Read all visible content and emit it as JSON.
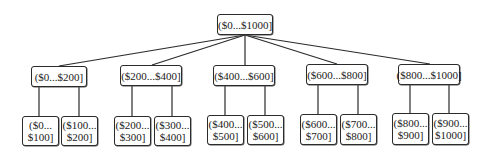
{
  "diagram": {
    "type": "tree",
    "root": {
      "label": "($0...$1000]",
      "box": [
        217,
        14,
        56,
        21
      ]
    },
    "level1": [
      {
        "label": "($0...$200]",
        "box": [
          31,
          66,
          56,
          21
        ],
        "anchor_x": 59
      },
      {
        "label": "($200...$400]",
        "box": [
          120,
          65,
          62,
          21
        ],
        "anchor_x": 152
      },
      {
        "label": "($400...$600]",
        "box": [
          213,
          65,
          62,
          21
        ],
        "anchor_x": 245
      },
      {
        "label": "($600...$800]",
        "box": [
          306,
          64,
          62,
          21
        ],
        "anchor_x": 337
      },
      {
        "label": "($800...$1000]",
        "box": [
          398,
          64,
          62,
          21
        ],
        "anchor_x": 430
      }
    ],
    "leaves": [
      {
        "line1": "($0...",
        "line2": "$100]",
        "box": [
          22,
          116,
          37,
          30
        ],
        "parent": 0,
        "line_x": 39
      },
      {
        "line1": "($100...",
        "line2": "$200]",
        "box": [
          61,
          116,
          37,
          30
        ],
        "parent": 0,
        "line_x": 79
      },
      {
        "line1": "($200...",
        "line2": "$300]",
        "box": [
          114,
          116,
          37,
          30
        ],
        "parent": 1,
        "line_x": 132
      },
      {
        "line1": "($300...",
        "line2": "$400]",
        "box": [
          154,
          116,
          37,
          30
        ],
        "parent": 1,
        "line_x": 172
      },
      {
        "line1": "($400...",
        "line2": "$500]",
        "box": [
          207,
          115,
          37,
          30
        ],
        "parent": 2,
        "line_x": 225
      },
      {
        "line1": "($500...",
        "line2": "$600]",
        "box": [
          247,
          115,
          37,
          30
        ],
        "parent": 2,
        "line_x": 265
      },
      {
        "line1": "($600...",
        "line2": "$700]",
        "box": [
          300,
          114,
          37,
          31
        ],
        "parent": 3,
        "line_x": 318
      },
      {
        "line1": "($700...",
        "line2": "$800]",
        "box": [
          340,
          114,
          37,
          31
        ],
        "parent": 3,
        "line_x": 358
      },
      {
        "line1": "($800...",
        "line2": "$900]",
        "box": [
          392,
          113,
          37,
          32
        ],
        "parent": 4,
        "line_x": 410
      },
      {
        "line1": "($900...",
        "line2": "$1000]",
        "box": [
          432,
          113,
          37,
          32
        ],
        "parent": 4,
        "line_x": 449
      }
    ],
    "colors": {
      "line": "#2b2b2b",
      "border": "#2b2b2b",
      "text": "#222222",
      "background": "#ffffff"
    }
  }
}
